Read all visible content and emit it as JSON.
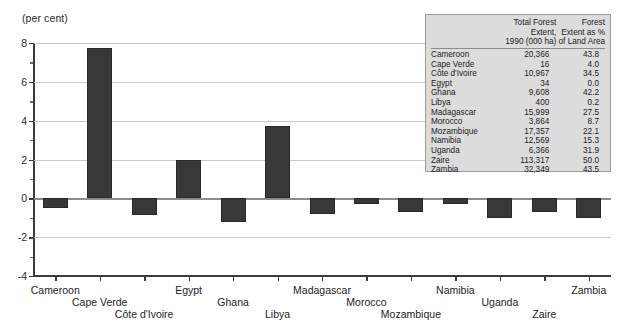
{
  "axis_unit_label": "(per cent)",
  "chart_data": {
    "type": "bar",
    "title": "",
    "subtitle": "",
    "xlabel": "",
    "ylabel": "(per cent)",
    "ylim": [
      -4,
      8
    ],
    "yticks": [
      -4,
      -2,
      0,
      2,
      4,
      6,
      8
    ],
    "ytick_labels": [
      "-4",
      "-2",
      "0",
      "2",
      "4",
      "6",
      "8"
    ],
    "minor_ticks": [
      -3,
      -1,
      1,
      3,
      5,
      7
    ],
    "grid": true,
    "grid_axis": "y",
    "legend": false,
    "bar_color": "#383838",
    "categories": [
      "Cameroon",
      "Cape Verde",
      "Côte d'Ivoire",
      "Egypt",
      "Ghana",
      "Libya",
      "Madagascar",
      "Morocco",
      "Mozambique",
      "Namibia",
      "Uganda",
      "Zaire",
      "Zambia"
    ],
    "values": [
      -0.5,
      7.75,
      -0.85,
      1.95,
      -1.2,
      3.75,
      -0.8,
      -0.3,
      -0.7,
      -0.3,
      -1.0,
      -0.7,
      -1.0
    ]
  },
  "table": {
    "columns": [
      "",
      "Total Forest Extent,\n1990 (000 ha)",
      "Forest\nExtent as %\nof Land Area"
    ],
    "header": {
      "col0": "",
      "col1_line1": "Total Forest Extent,",
      "col1_line2": "1990 (000 ha)",
      "col2_line1": "Forest",
      "col2_line2": "Extent as %",
      "col2_line3": "of Land Area"
    },
    "rows": [
      {
        "country": "Cameroon",
        "extent": "20,366",
        "pct": "43.8"
      },
      {
        "country": "Cape Verde",
        "extent": "16",
        "pct": "4.0"
      },
      {
        "country": "Côte d'Ivoire",
        "extent": "10,967",
        "pct": "34.5"
      },
      {
        "country": "Egypt",
        "extent": "34",
        "pct": "0.0"
      },
      {
        "country": "Ghana",
        "extent": "9,608",
        "pct": "42.2"
      },
      {
        "country": "Libya",
        "extent": "400",
        "pct": "0.2"
      },
      {
        "country": "Madagascar",
        "extent": "15,999",
        "pct": "27.5"
      },
      {
        "country": "Morocco",
        "extent": "3,864",
        "pct": "8.7"
      },
      {
        "country": "Mozambique",
        "extent": "17,357",
        "pct": "22.1"
      },
      {
        "country": "Namibia",
        "extent": "12,569",
        "pct": "15.3"
      },
      {
        "country": "Uganda",
        "extent": "6,366",
        "pct": "31.9"
      },
      {
        "country": "Zaire",
        "extent": "113,317",
        "pct": "50.0"
      },
      {
        "country": "Zambia",
        "extent": "32,349",
        "pct": "43.5"
      }
    ]
  }
}
